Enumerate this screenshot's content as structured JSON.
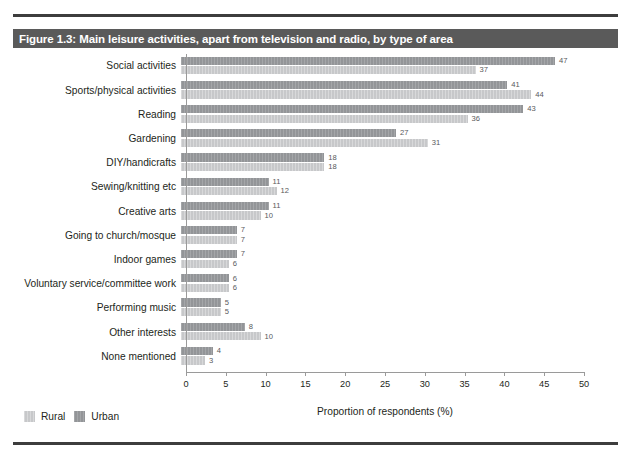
{
  "figure": {
    "title": "Figure 1.3: Main leisure activities, apart from television and radio, by type of area",
    "title_band_color": "#5a5a5a",
    "rule_color": "#3d3d3d"
  },
  "legend": {
    "position": "bottom-left",
    "items": [
      {
        "label": "Rural",
        "color": "#c7c8ca"
      },
      {
        "label": "Urban",
        "color": "#939598"
      }
    ]
  },
  "axis": {
    "xlabel": "Proportion of respondents (%)",
    "ticks": [
      "0",
      "5",
      "10",
      "15",
      "20",
      "25",
      "30",
      "35",
      "40",
      "45",
      "50"
    ]
  },
  "chart_data": {
    "type": "bar",
    "orientation": "horizontal",
    "title": "Figure 1.3: Main leisure activities, apart from television and radio, by type of area",
    "xlabel": "Proportion of respondents (%)",
    "ylabel": "",
    "xlim": [
      0,
      50
    ],
    "xticks": [
      0,
      5,
      10,
      15,
      20,
      25,
      30,
      35,
      40,
      45,
      50
    ],
    "grid": false,
    "legend_position": "bottom-left",
    "categories": [
      "Social activities",
      "Sports/physical activities",
      "Reading",
      "Gardening",
      "DIY/handicrafts",
      "Sewing/knitting etc",
      "Creative arts",
      "Going to church/mosque",
      "Indoor games",
      "Voluntary service/committee work",
      "Performing music",
      "Other interests",
      "None mentioned"
    ],
    "series": [
      {
        "name": "Urban",
        "color": "#939598",
        "values": [
          47,
          41,
          43,
          27,
          18,
          11,
          11,
          7,
          7,
          6,
          5,
          8,
          4
        ]
      },
      {
        "name": "Rural",
        "color": "#c7c8ca",
        "values": [
          37,
          44,
          36,
          31,
          18,
          12,
          10,
          7,
          6,
          6,
          5,
          10,
          3
        ]
      }
    ]
  }
}
